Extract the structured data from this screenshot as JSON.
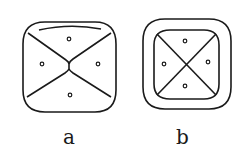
{
  "figures": [
    {
      "id": "a",
      "label": "a",
      "description": "Rounded square with four sectors meeting at a short vertical waist; arc near top; one small circle per sector"
    },
    {
      "id": "b",
      "label": "b",
      "description": "Double rounded square (outer and inner border); inner square divided by an X into four sectors; one small circle per sector"
    }
  ],
  "colors": {
    "stroke": "#1a1a1a",
    "background": "#ffffff"
  }
}
